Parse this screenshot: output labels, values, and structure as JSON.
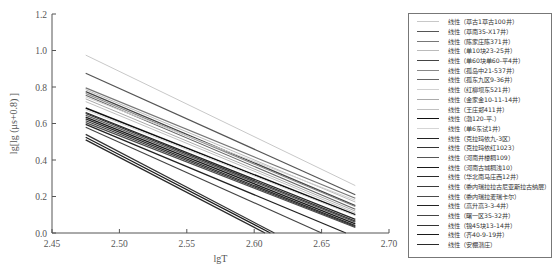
{
  "chart_data": {
    "type": "line",
    "title": "",
    "xlabel": "lgT",
    "ylabel": "lg[lg (μs+0.8) ]",
    "xlim": [
      2.45,
      2.7
    ],
    "ylim": [
      0.0,
      1.2
    ],
    "x_ticks": [
      "2.45",
      "2.50",
      "2.55",
      "2.60",
      "2.65",
      "2.70"
    ],
    "y_ticks": [
      "0.0",
      "0.2",
      "0.4",
      "0.6",
      "0.8",
      "1.0",
      "1.2"
    ],
    "grid": false,
    "legend_position": "right",
    "series": [
      {
        "name": "线性（草古1草古100井）",
        "color": "#c8c8c8",
        "width": 1.0,
        "x": [
          2.475,
          2.675
        ],
        "y": [
          0.975,
          0.26
        ]
      },
      {
        "name": "线性（草南35-X17井）",
        "color": "#555555",
        "width": 1.2,
        "x": [
          2.475,
          2.675
        ],
        "y": [
          0.875,
          0.21
        ]
      },
      {
        "name": "线性（陈家庄陈371井）",
        "color": "#777777",
        "width": 1.2,
        "x": [
          2.475,
          2.675
        ],
        "y": [
          0.795,
          0.19
        ]
      },
      {
        "name": "线性（单10块23-25井）",
        "color": "#bbbbbb",
        "width": 1.0,
        "x": [
          2.475,
          2.675
        ],
        "y": [
          0.785,
          0.17
        ]
      },
      {
        "name": "线性（单60块单60-平4井）",
        "color": "#444444",
        "width": 1.3,
        "x": [
          2.475,
          2.675
        ],
        "y": [
          0.775,
          0.15
        ]
      },
      {
        "name": "线性（孤岛中21-537井）",
        "color": "#888888",
        "width": 1.1,
        "x": [
          2.475,
          2.675
        ],
        "y": [
          0.765,
          0.145
        ]
      },
      {
        "name": "线性（孤东九区9-36井）",
        "color": "#666666",
        "width": 1.1,
        "x": [
          2.475,
          2.675
        ],
        "y": [
          0.755,
          0.13
        ]
      },
      {
        "name": "线性（红柳坝东521井）",
        "color": "#d0d0d0",
        "width": 1.0,
        "x": [
          2.475,
          2.675
        ],
        "y": [
          0.745,
          0.18
        ]
      },
      {
        "name": "线性（金家金10-11-14井）",
        "color": "#aaaaaa",
        "width": 1.0,
        "x": [
          2.475,
          2.675
        ],
        "y": [
          0.735,
          0.12
        ]
      },
      {
        "name": "线性（王庄郑411井）",
        "color": "#c0c0c0",
        "width": 1.0,
        "x": [
          2.475,
          2.675
        ],
        "y": [
          0.72,
          0.11
        ]
      },
      {
        "name": "线性（渤120-平.）",
        "color": "#111111",
        "width": 1.5,
        "x": [
          2.475,
          2.675
        ],
        "y": [
          0.685,
          0.1
        ]
      },
      {
        "name": "线性（单6东试1井）",
        "color": "#d5d5d5",
        "width": 1.0,
        "x": [
          2.475,
          2.675
        ],
        "y": [
          0.675,
          0.095
        ]
      },
      {
        "name": "线性（克拉玛依九-3区）",
        "color": "#222222",
        "width": 1.3,
        "x": [
          2.475,
          2.675
        ],
        "y": [
          0.66,
          0.075
        ]
      },
      {
        "name": "线性（克拉玛依红1023）",
        "color": "#333333",
        "width": 1.3,
        "x": [
          2.475,
          2.675
        ],
        "y": [
          0.655,
          0.065
        ]
      },
      {
        "name": "线性（河南井楼稠109）",
        "color": "#555555",
        "width": 1.2,
        "x": [
          2.475,
          2.675
        ],
        "y": [
          0.645,
          0.06
        ]
      },
      {
        "name": "线性（河南古城稠浅10）",
        "color": "#1a1a1a",
        "width": 1.3,
        "x": [
          2.475,
          2.675
        ],
        "y": [
          0.635,
          0.05
        ]
      },
      {
        "name": "线性（华北南马庄西12井）",
        "color": "#2a2a2a",
        "width": 1.3,
        "x": [
          2.475,
          2.675
        ],
        "y": [
          0.625,
          0.04
        ]
      },
      {
        "name": "线性（委内瑞拉拉古尼亚斯拉古纳层）",
        "color": "#3a3a3a",
        "width": 1.2,
        "x": [
          2.475,
          2.675
        ],
        "y": [
          0.615,
          0.035
        ]
      },
      {
        "name": "线性（委内瑞拉麦瑞卡尔）",
        "color": "#4a4a4a",
        "width": 1.2,
        "x": [
          2.475,
          2.675
        ],
        "y": [
          0.605,
          0.03
        ]
      },
      {
        "name": "线性（高升高3-3-4井）",
        "color": "#222222",
        "width": 1.3,
        "x": [
          2.475,
          2.668
        ],
        "y": [
          0.595,
          0.0
        ]
      },
      {
        "name": "线性（曙一区35-32井）",
        "color": "#444444",
        "width": 1.1,
        "x": [
          2.475,
          2.65
        ],
        "y": [
          0.58,
          0.0
        ]
      },
      {
        "name": "线性（锦45块13-14井）",
        "color": "#333333",
        "width": 1.2,
        "x": [
          2.475,
          2.615
        ],
        "y": [
          0.54,
          0.0
        ]
      },
      {
        "name": "线性（齐40-9-19井）",
        "color": "#1a1a1a",
        "width": 1.2,
        "x": [
          2.475,
          2.612
        ],
        "y": [
          0.525,
          0.0
        ]
      },
      {
        "name": "线性（安棚潜庄）",
        "color": "#2a2a2a",
        "width": 1.3,
        "x": [
          2.475,
          2.608
        ],
        "y": [
          0.51,
          0.0
        ]
      }
    ]
  }
}
